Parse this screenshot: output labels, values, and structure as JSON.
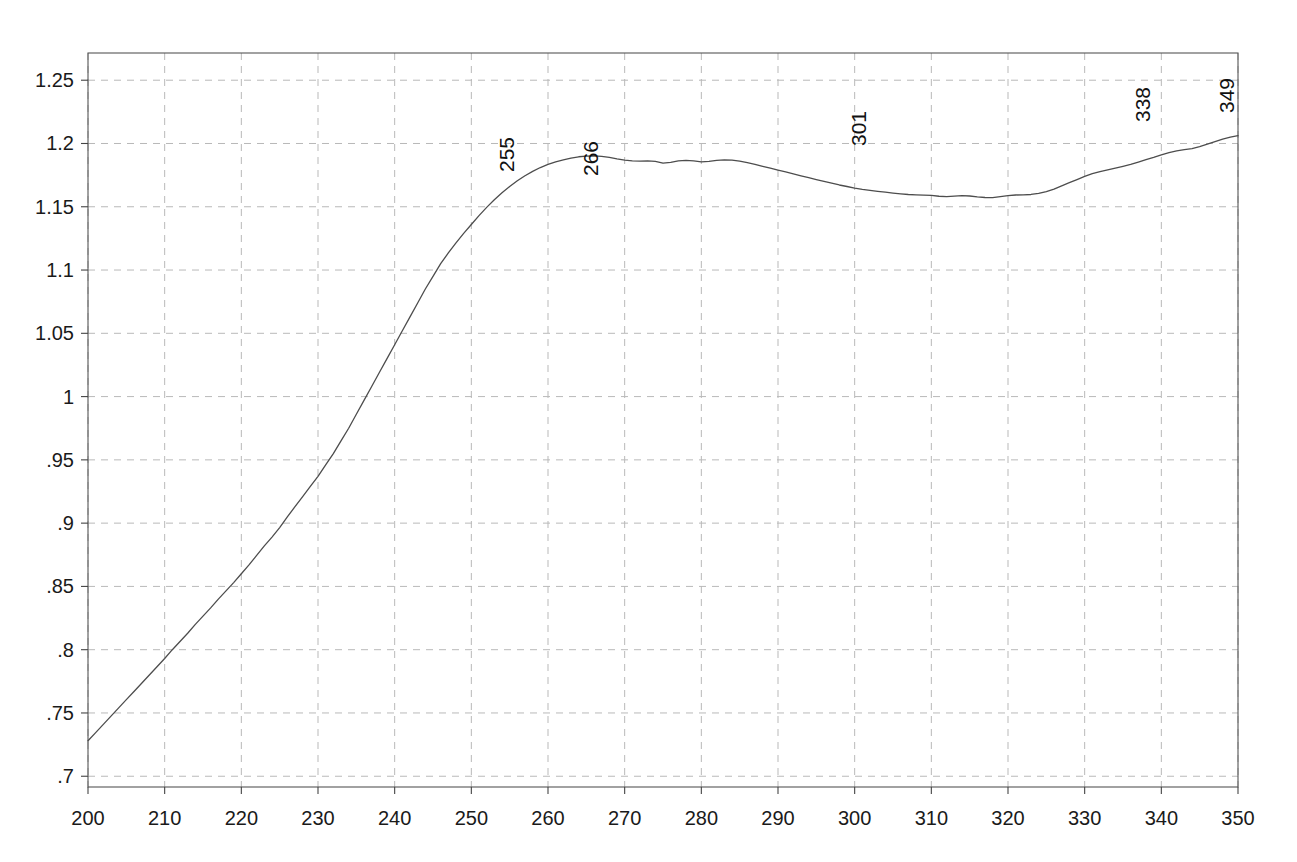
{
  "chart_data": {
    "type": "line",
    "title": "",
    "subtitle": "",
    "xlabel": "",
    "ylabel": "",
    "xlim": [
      200,
      350
    ],
    "ylim": [
      0.6915,
      1.2715
    ],
    "xticks": [
      200,
      210,
      220,
      230,
      240,
      250,
      260,
      270,
      280,
      290,
      300,
      310,
      320,
      330,
      340,
      350
    ],
    "xtick_labels": [
      "200",
      "210",
      "220",
      "230",
      "240",
      "250",
      "260",
      "270",
      "280",
      "290",
      "300",
      "310",
      "320",
      "330",
      "340",
      "350"
    ],
    "yticks": [
      0.7,
      0.75,
      0.8,
      0.85,
      0.9,
      0.95,
      1.0,
      1.05,
      1.1,
      1.15,
      1.2,
      1.25
    ],
    "ytick_labels": [
      ".7",
      ".75",
      ".8",
      ".85",
      ".9",
      ".95",
      "1",
      "1.05",
      "1.1",
      "1.15",
      "1.2",
      "1.25"
    ],
    "grid": true,
    "grid_style": "dashed",
    "grid_color": "#b9b9b9",
    "line_color": "#4d4d4d",
    "line_width": 1.3,
    "frame_color": "#555555",
    "legend": null,
    "legend_position": "none",
    "annotations": [
      {
        "label": "255",
        "x": 255,
        "y": 1.19
      },
      {
        "label": "266",
        "x": 266,
        "y": 1.187
      },
      {
        "label": "301",
        "x": 301,
        "y": 1.211
      },
      {
        "label": "338",
        "x": 338,
        "y": 1.23
      },
      {
        "label": "349",
        "x": 349,
        "y": 1.237
      }
    ],
    "x": [
      200,
      201,
      202,
      203,
      204,
      205,
      206,
      207,
      208,
      209,
      210,
      211,
      212,
      213,
      214,
      215,
      216,
      217,
      218,
      219,
      220,
      221,
      222,
      223,
      224,
      225,
      226,
      227,
      228,
      229,
      230,
      231,
      232,
      233,
      234,
      235,
      236,
      237,
      238,
      239,
      240,
      241,
      242,
      243,
      244,
      245,
      246,
      247,
      248,
      249,
      250,
      251,
      252,
      253,
      254,
      255,
      256,
      257,
      258,
      259,
      260,
      261,
      262,
      263,
      264,
      265,
      266,
      267,
      268,
      269,
      270,
      271,
      272,
      273,
      274,
      275,
      276,
      277,
      278,
      279,
      280,
      281,
      282,
      283,
      284,
      285,
      286,
      287,
      288,
      289,
      290,
      291,
      292,
      293,
      294,
      295,
      296,
      297,
      298,
      299,
      300,
      301,
      302,
      303,
      304,
      305,
      306,
      307,
      308,
      309,
      310,
      311,
      312,
      313,
      314,
      315,
      316,
      317,
      318,
      319,
      320,
      321,
      322,
      323,
      324,
      325,
      326,
      327,
      328,
      329,
      330,
      331,
      332,
      333,
      334,
      335,
      336,
      337,
      338,
      339,
      340,
      341,
      342,
      343,
      344,
      345,
      346,
      347,
      348,
      349,
      350
    ],
    "y": [
      0.728,
      0.7345,
      0.741,
      0.7475,
      0.754,
      0.7605,
      0.767,
      0.7735,
      0.78,
      0.7865,
      0.793,
      0.8,
      0.8065,
      0.813,
      0.82,
      0.8265,
      0.833,
      0.84,
      0.8465,
      0.853,
      0.86,
      0.867,
      0.8745,
      0.882,
      0.889,
      0.8965,
      0.905,
      0.913,
      0.921,
      0.929,
      0.937,
      0.946,
      0.955,
      0.965,
      0.975,
      0.986,
      0.997,
      1.008,
      1.019,
      1.03,
      1.041,
      1.052,
      1.063,
      1.074,
      1.085,
      1.095,
      1.105,
      1.1135,
      1.1215,
      1.129,
      1.136,
      1.143,
      1.1495,
      1.1555,
      1.161,
      1.166,
      1.1705,
      1.1745,
      1.178,
      1.181,
      1.1835,
      1.1855,
      1.187,
      1.1885,
      1.1895,
      1.19,
      1.1902,
      1.1898,
      1.189,
      1.1878,
      1.1868,
      1.1862,
      1.186,
      1.1862,
      1.1858,
      1.1845,
      1.185,
      1.1862,
      1.1866,
      1.1862,
      1.1855,
      1.1858,
      1.1866,
      1.187,
      1.1868,
      1.186,
      1.1848,
      1.1835,
      1.182,
      1.1805,
      1.179,
      1.1775,
      1.176,
      1.1745,
      1.173,
      1.1715,
      1.17,
      1.1686,
      1.1672,
      1.166,
      1.1648,
      1.1638,
      1.163,
      1.1622,
      1.1615,
      1.1608,
      1.1602,
      1.1597,
      1.1594,
      1.1592,
      1.159,
      1.1583,
      1.158,
      1.1584,
      1.1588,
      1.1585,
      1.1578,
      1.1573,
      1.1572,
      1.158,
      1.1588,
      1.1593,
      1.1594,
      1.1597,
      1.1605,
      1.162,
      1.164,
      1.1665,
      1.169,
      1.1715,
      1.174,
      1.1762,
      1.1778,
      1.1792,
      1.1806,
      1.182,
      1.1835,
      1.1853,
      1.1872,
      1.189,
      1.191,
      1.1928,
      1.1942,
      1.1952,
      1.196,
      1.1975,
      1.1995,
      1.2015,
      1.2035,
      1.205,
      1.2062,
      1.2078,
      1.2095,
      1.2108,
      1.2105,
      1.2095,
      1.2098,
      1.2108,
      1.211,
      1.2106,
      1.2098,
      1.2095,
      1.2097,
      1.2095,
      1.2088,
      1.2078,
      1.2065,
      1.205,
      1.203,
      1.2005,
      1.1975,
      1.194,
      1.19,
      1.186,
      1.182,
      1.178,
      1.174,
      1.17,
      1.1665,
      1.1635,
      1.161,
      1.1588,
      1.157,
      1.1555,
      1.1542,
      1.1532,
      1.1522,
      1.1512,
      1.1504,
      1.1498,
      1.1493,
      1.149,
      1.1492,
      1.1498,
      1.1508,
      1.152,
      1.1535,
      1.1552,
      1.157,
      1.1588,
      1.1608,
      1.1628,
      1.1648,
      1.1668,
      1.1688,
      1.171,
      1.1732,
      1.1752,
      1.1772,
      1.179,
      1.1808,
      1.1826,
      1.1844,
      1.186,
      1.1875,
      1.189,
      1.1905,
      1.192,
      1.1935,
      1.195,
      1.1962,
      1.1975,
      1.199,
      1.2005,
      1.2015,
      1.2015,
      1.2012,
      1.2015,
      1.2028,
      1.2045,
      1.2062,
      1.208,
      1.2098,
      1.2115,
      1.2135,
      1.216,
      1.2195,
      1.2255,
      1.23,
      1.2255,
      1.2215,
      1.2205,
      1.2198,
      1.2198,
      1.2205,
      1.2215,
      1.2225,
      1.2235,
      1.2238,
      1.2232,
      1.2222,
      1.2212,
      1.2208,
      1.2215,
      1.2228,
      1.2245,
      1.2262,
      1.2275,
      1.2272,
      1.2262,
      1.2255,
      1.2258,
      1.2272,
      1.2295,
      1.2322,
      1.2352,
      1.237,
      1.2358
    ]
  },
  "plot_geometry": {
    "left": 88,
    "top": 53,
    "right": 1238,
    "bottom": 787
  }
}
